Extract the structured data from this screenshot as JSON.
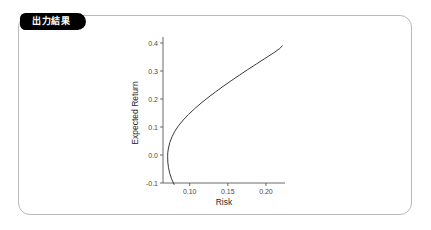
{
  "panel": {
    "tab_label": "出力結果",
    "border_color": "#b9b9b9",
    "tab_color": "#000000",
    "background_color": "#ffffff"
  },
  "chart_data": {
    "type": "line",
    "title": "",
    "xlabel": "Risk",
    "ylabel": "Expected Return",
    "xlim": [
      0.065,
      0.225
    ],
    "ylim": [
      -0.115,
      0.425
    ],
    "xticks": [
      0.1,
      0.15,
      0.2
    ],
    "xticklabels": [
      "0.10",
      "0.15",
      "0.20"
    ],
    "yticks": [
      -0.1,
      0.0,
      0.1,
      0.2,
      0.3,
      0.4
    ],
    "yticklabels": [
      "-0.1",
      "0.0",
      "0.1",
      "0.2",
      "0.3",
      "0.4"
    ],
    "grid": false,
    "legend": null,
    "line_color": "#3a3a3a",
    "series": [
      {
        "name": "Efficient frontier",
        "points": [
          [
            0.0795,
            -0.105
          ],
          [
            0.0762,
            -0.085
          ],
          [
            0.0738,
            -0.065
          ],
          [
            0.0722,
            -0.045
          ],
          [
            0.0713,
            -0.025
          ],
          [
            0.0711,
            -0.005
          ],
          [
            0.0713,
            0.01
          ],
          [
            0.0722,
            0.025
          ],
          [
            0.074,
            0.045
          ],
          [
            0.0768,
            0.065
          ],
          [
            0.0806,
            0.085
          ],
          [
            0.0855,
            0.105
          ],
          [
            0.0915,
            0.125
          ],
          [
            0.0985,
            0.145
          ],
          [
            0.1063,
            0.165
          ],
          [
            0.1148,
            0.185
          ],
          [
            0.124,
            0.205
          ],
          [
            0.1337,
            0.225
          ],
          [
            0.1438,
            0.245
          ],
          [
            0.1543,
            0.265
          ],
          [
            0.1651,
            0.285
          ],
          [
            0.1761,
            0.305
          ],
          [
            0.1874,
            0.325
          ],
          [
            0.1988,
            0.345
          ],
          [
            0.2103,
            0.365
          ],
          [
            0.218,
            0.38
          ],
          [
            0.2215,
            0.39
          ]
        ]
      }
    ]
  }
}
